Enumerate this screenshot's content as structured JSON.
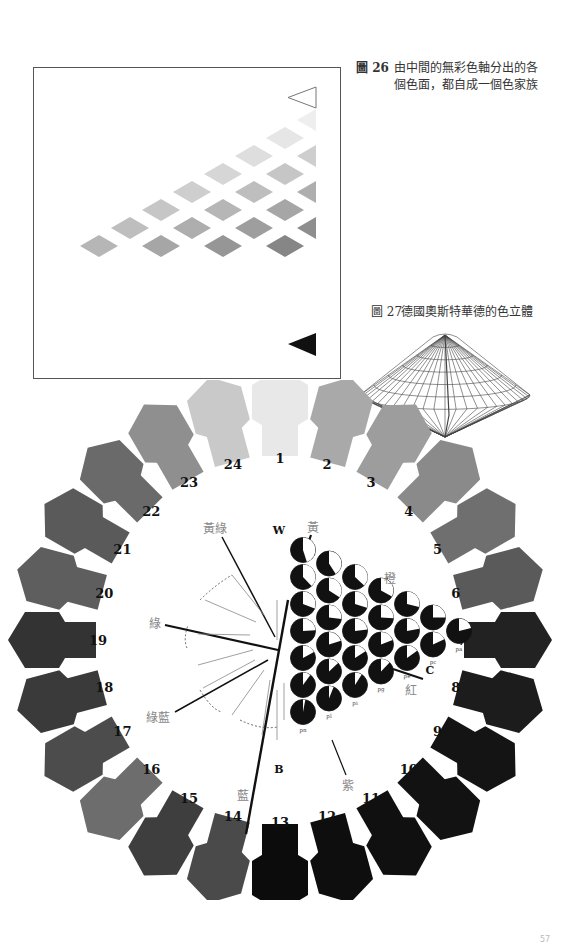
{
  "figure26": {
    "number": "圖 26",
    "caption_line1": "由中間的無彩色軸分出的各",
    "caption_line2": "個色面，都自成一個色家族",
    "top_marker": "hollow-triangle",
    "bottom_marker": "solid-triangle",
    "diamond_rows": 7
  },
  "figure27": {
    "number": "圖 27",
    "caption": "德國奧斯特華德的色立體"
  },
  "color_circle": {
    "hue_numbers": [
      "1",
      "2",
      "3",
      "4",
      "5",
      "6",
      "7",
      "8",
      "9",
      "10",
      "11",
      "12",
      "13",
      "14",
      "15",
      "16",
      "17",
      "18",
      "19",
      "20",
      "21",
      "22",
      "23",
      "24"
    ],
    "hue_shades": [
      "#e8e8e8",
      "#a9a9a9",
      "#9d9d9d",
      "#8a8a8a",
      "#6f6f6f",
      "#5a5a5a",
      "#222222",
      "#1c1c1c",
      "#141414",
      "#121212",
      "#101010",
      "#0e0e0e",
      "#0c0c0c",
      "#4a4a4a",
      "#3e3e3e",
      "#6d6d6d",
      "#4c4c4c",
      "#3a3a3a",
      "#333333",
      "#5e5e5e",
      "#5a5a5a",
      "#6a6a6a",
      "#8f8f8f",
      "#c9c9c9"
    ],
    "axis_labels": {
      "white": "W",
      "color": "C",
      "black": "B"
    },
    "hue_labels": {
      "yellow": "黃",
      "orange": "橙",
      "red": "紅",
      "purple": "紫",
      "blue": "藍",
      "green_blue": "綠藍",
      "green": "綠",
      "yellow_green": "黃綠"
    },
    "triangle_codes": [
      [
        "ca"
      ],
      [
        "ec",
        "ea"
      ],
      [
        "ge",
        "gc",
        "ga"
      ],
      [
        "ig",
        "ie",
        "ic",
        "ia"
      ],
      [
        "li",
        "lg",
        "le",
        "lc",
        "la"
      ],
      [
        "nl",
        "ni",
        "ng",
        "ne",
        "nc",
        "na"
      ],
      [
        "pn",
        "pl",
        "pi",
        "pg",
        "pe",
        "pc",
        "pa"
      ]
    ]
  },
  "page": {
    "number": "57"
  }
}
